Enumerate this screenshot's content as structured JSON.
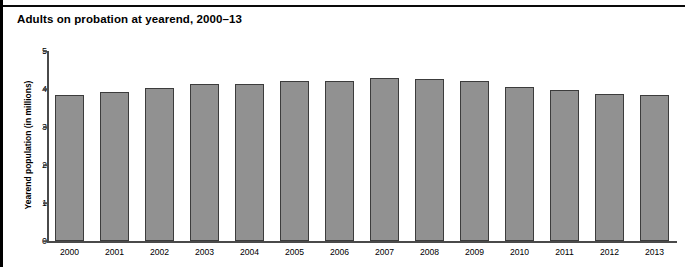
{
  "chart_data": {
    "type": "bar",
    "title": "Adults on probation at yearend, 2000–13",
    "xlabel": "",
    "ylabel": "Yearend population (in millions)",
    "categories": [
      "2000",
      "2001",
      "2002",
      "2003",
      "2004",
      "2005",
      "2006",
      "2007",
      "2008",
      "2009",
      "2010",
      "2011",
      "2012",
      "2013"
    ],
    "values": [
      3.83,
      3.93,
      4.02,
      4.12,
      4.14,
      4.22,
      4.21,
      4.29,
      4.27,
      4.2,
      4.06,
      3.97,
      3.86,
      3.85
    ],
    "ylim": [
      0,
      5
    ],
    "yticks": [
      "0",
      "1",
      "2",
      "3",
      "4",
      "5"
    ],
    "grid": false,
    "legend": null,
    "bar_color": "#919191",
    "bar_edge_color": "#3c3c3c",
    "axis_color": "#4a4a4a",
    "text_color": "#000000",
    "background": "#ffffff"
  }
}
